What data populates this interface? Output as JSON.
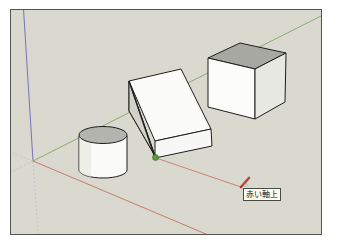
{
  "app": {
    "name": "SketchUp",
    "view": "3D modeling viewport"
  },
  "viewport": {
    "background": "#d9d9d0",
    "axes": {
      "red_axis_color": "#c8705e",
      "green_axis_color": "#7fa866",
      "blue_axis_color": "#6a6ab0"
    },
    "objects": [
      {
        "name": "cylinder",
        "type": "cylinder"
      },
      {
        "name": "wedge",
        "type": "triangular-prism"
      },
      {
        "name": "cube",
        "type": "box"
      }
    ],
    "inference_point": {
      "color": "#5a9a3e",
      "type": "endpoint"
    },
    "cursor": {
      "tool": "pencil-line-tool",
      "color": "#b34a35"
    }
  },
  "tooltip": {
    "text": "赤い軸上"
  }
}
